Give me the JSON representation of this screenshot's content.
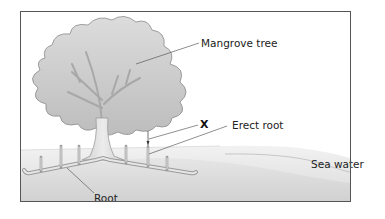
{
  "diagram": {
    "labels": {
      "tree": "Mangrove tree",
      "marker": "X",
      "erect_root": "Erect root",
      "sea_water": "Sea water",
      "root": "Root"
    },
    "colors": {
      "frame": "#555555",
      "canopy": "#c9c9c9",
      "canopy_outline": "#8a8a8a",
      "trunk": "#d6d6d6",
      "sea_water": "#e2e2e2",
      "ground": "#d4d4d4",
      "leader_line": "#444444"
    }
  }
}
